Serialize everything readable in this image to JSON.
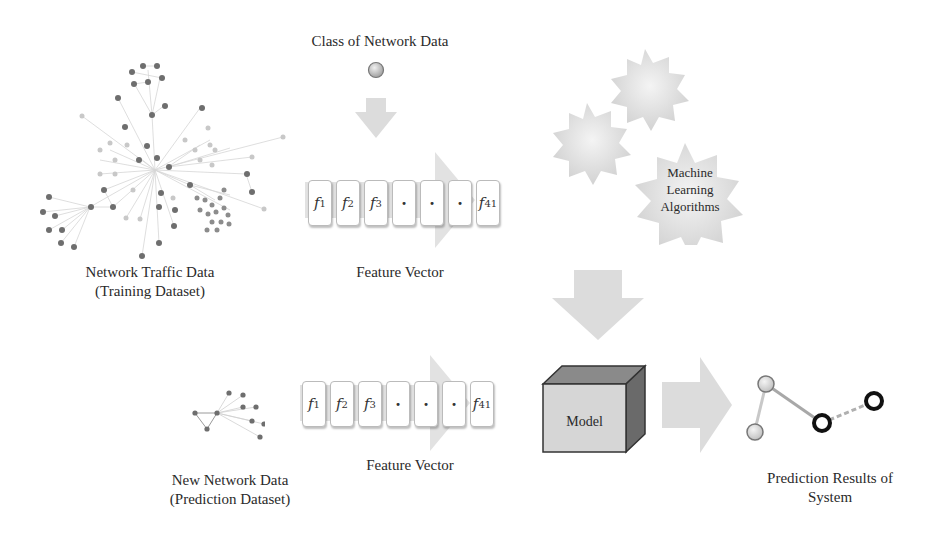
{
  "diagram": {
    "type": "ml-pipeline-flow",
    "training_source": {
      "label_line1": "Network Traffic Data",
      "label_line2": "(Training Dataset)",
      "icon": "network-graph-icon"
    },
    "class_label": {
      "label": "Class of Network Data",
      "icon": "class-node-icon"
    },
    "feature_vector_top": {
      "label": "Feature Vector",
      "cells": [
        {
          "base": "f",
          "sub": "1"
        },
        {
          "base": "f",
          "sub": "2"
        },
        {
          "base": "f",
          "sub": "3"
        },
        {
          "base": "·",
          "sub": ""
        },
        {
          "base": "·",
          "sub": ""
        },
        {
          "base": "·",
          "sub": ""
        },
        {
          "base": "f",
          "sub": "41"
        }
      ]
    },
    "algorithms": {
      "line1": "Machine",
      "line2": "Learning",
      "line3": "Algorithms",
      "icon": "gears-icon"
    },
    "prediction_source": {
      "label_line1": "New Network Data",
      "label_line2": "(Prediction Dataset)",
      "icon": "small-network-graph-icon"
    },
    "feature_vector_bottom": {
      "label": "Feature Vector",
      "cells": [
        {
          "base": "f",
          "sub": "1"
        },
        {
          "base": "f",
          "sub": "2"
        },
        {
          "base": "f",
          "sub": "3"
        },
        {
          "base": "·",
          "sub": ""
        },
        {
          "base": "·",
          "sub": ""
        },
        {
          "base": "·",
          "sub": ""
        },
        {
          "base": "f",
          "sub": "41"
        }
      ]
    },
    "model": {
      "label": "Model",
      "icon": "cube-icon"
    },
    "result": {
      "label_line1": "Prediction Results of",
      "label_line2": "System",
      "icon": "result-nodes-icon"
    },
    "colors": {
      "arrow": "#dcdcdc",
      "node_dark": "#6e6e6e",
      "node_light": "#c8c8c8",
      "edge": "#d4d4d4",
      "cube_front": "#d6d6d6",
      "cube_top": "#8a8a8a",
      "cube_side": "#6a6a6a"
    }
  }
}
